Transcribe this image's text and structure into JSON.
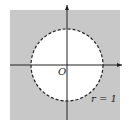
{
  "diagram": {
    "origin_label": "O",
    "radius_label": "r = 1",
    "colors": {
      "shade": "#c8c8c8",
      "disk": "#ffffff",
      "axis": "#222222",
      "circle": "#222222"
    }
  }
}
